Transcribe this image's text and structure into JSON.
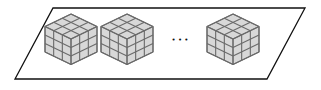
{
  "diagram": {
    "plane": {
      "points": [
        [
          53,
          8
        ],
        [
          305,
          8
        ],
        [
          267,
          79
        ],
        [
          15,
          79
        ]
      ],
      "stroke": "#111111"
    },
    "cubes": [
      {
        "cx": 71,
        "cy": 39
      },
      {
        "cx": 127,
        "cy": 39
      },
      {
        "cx": 233,
        "cy": 39
      }
    ],
    "cube_size": 3,
    "cube_face_color": "#d8d8d8",
    "cube_line_color": "#6a6a6a",
    "ellipsis": "• • •"
  }
}
